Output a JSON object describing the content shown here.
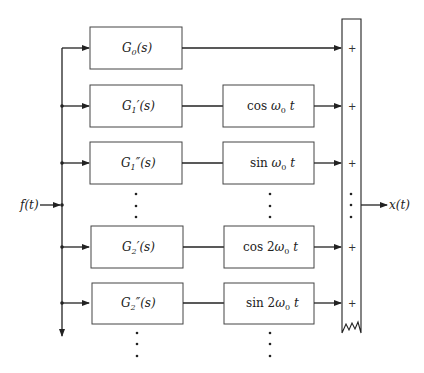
{
  "diagram": {
    "type": "block-diagram",
    "input": {
      "label": "f(t)"
    },
    "output": {
      "label": "x(t)"
    },
    "filters": [
      {
        "name": "G",
        "sub": "0",
        "prime": "",
        "arg": "(s)"
      },
      {
        "name": "G",
        "sub": "1",
        "prime": "′",
        "arg": "(s)"
      },
      {
        "name": "G",
        "sub": "1",
        "prime": "″",
        "arg": "(s)"
      },
      {
        "name": "G",
        "sub": "2",
        "prime": "′",
        "arg": "(s)"
      },
      {
        "name": "G",
        "sub": "2",
        "prime": "″",
        "arg": "(s)"
      }
    ],
    "modulators": [
      {
        "fn": "cos",
        "coef": "",
        "sub": "0",
        "t": "t"
      },
      {
        "fn": "sin",
        "coef": "",
        "sub": "0",
        "t": "t"
      },
      {
        "fn": "cos",
        "coef": "2",
        "sub": "0",
        "t": "t"
      },
      {
        "fn": "sin",
        "coef": "2",
        "sub": "0",
        "t": "t"
      }
    ],
    "summer": {
      "signs": [
        "+",
        "+",
        "+",
        "+",
        "+"
      ],
      "continuation": "⋮"
    },
    "ellipsis": "⋮"
  }
}
